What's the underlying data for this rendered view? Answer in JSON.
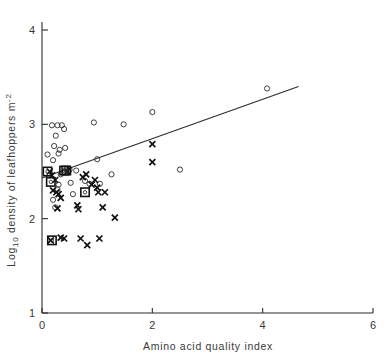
{
  "chart_data": {
    "type": "scatter",
    "title": "",
    "xlabel": "Amino acid quality index",
    "ylabel": "Log10 density of leafhoppers m-2",
    "ylabel_display": "Log₁₀ density of leafhoppers m⁻²",
    "xlim": [
      0,
      6
    ],
    "ylim": [
      1,
      4
    ],
    "xticks": [
      0,
      2,
      4,
      6
    ],
    "xticklabels": [
      "0",
      "2",
      "4",
      "6"
    ],
    "yticks": [
      1,
      2,
      3,
      4
    ],
    "yticklabels": [
      "1",
      "2",
      "3",
      "4"
    ],
    "grid": false,
    "legend": "none",
    "marker_types": [
      "open-circle",
      "cross",
      "boxed"
    ],
    "series": [
      {
        "name": "open-circle",
        "marker": "open-circle",
        "points": [
          [
            0.1,
            2.68
          ],
          [
            0.18,
            2.99
          ],
          [
            0.2,
            2.62
          ],
          [
            0.22,
            2.77
          ],
          [
            0.25,
            2.88
          ],
          [
            0.28,
            2.99
          ],
          [
            0.3,
            2.69
          ],
          [
            0.32,
            2.73
          ],
          [
            0.3,
            2.36
          ],
          [
            0.34,
            2.47
          ],
          [
            0.36,
            2.99
          ],
          [
            0.4,
            2.95
          ],
          [
            0.42,
            2.75
          ],
          [
            0.2,
            2.2
          ],
          [
            0.24,
            2.12
          ],
          [
            0.28,
            2.31
          ],
          [
            0.44,
            2.52
          ],
          [
            0.48,
            2.5
          ],
          [
            0.5,
            2.52
          ],
          [
            0.52,
            2.38
          ],
          [
            0.56,
            2.26
          ],
          [
            0.62,
            2.51
          ],
          [
            0.78,
            2.4
          ],
          [
            0.86,
            2.37
          ],
          [
            0.94,
            3.02
          ],
          [
            1.0,
            2.63
          ],
          [
            1.05,
            2.37
          ],
          [
            1.26,
            2.47
          ],
          [
            1.48,
            3.0
          ],
          [
            2.0,
            3.13
          ],
          [
            2.5,
            2.52
          ],
          [
            4.08,
            3.38
          ]
        ]
      },
      {
        "name": "cross",
        "marker": "cross",
        "points": [
          [
            0.14,
            2.5
          ],
          [
            0.18,
            2.46
          ],
          [
            0.2,
            2.3
          ],
          [
            0.24,
            2.41
          ],
          [
            0.26,
            2.28
          ],
          [
            0.3,
            2.26
          ],
          [
            0.34,
            2.22
          ],
          [
            0.16,
            1.77
          ],
          [
            0.28,
            2.11
          ],
          [
            0.34,
            1.8
          ],
          [
            0.4,
            1.79
          ],
          [
            0.46,
            2.5
          ],
          [
            0.64,
            2.14
          ],
          [
            0.66,
            2.1
          ],
          [
            0.7,
            1.79
          ],
          [
            0.74,
            2.44
          ],
          [
            0.8,
            2.47
          ],
          [
            0.82,
            1.72
          ],
          [
            0.9,
            2.36
          ],
          [
            0.96,
            2.41
          ],
          [
            1.0,
            2.33
          ],
          [
            1.02,
            2.28
          ],
          [
            1.04,
            1.79
          ],
          [
            1.1,
            2.12
          ],
          [
            1.14,
            2.28
          ],
          [
            1.32,
            2.01
          ],
          [
            2.0,
            2.79
          ],
          [
            2.0,
            2.6
          ]
        ]
      },
      {
        "name": "boxed",
        "marker": "boxed",
        "points": [
          [
            0.1,
            2.5
          ],
          [
            0.16,
            2.39
          ],
          [
            0.4,
            2.51
          ],
          [
            0.44,
            2.51
          ],
          [
            0.18,
            1.77
          ],
          [
            0.78,
            2.28
          ]
        ]
      }
    ],
    "regression_line": {
      "x_start": 0.0,
      "y_start": 2.43,
      "x_end": 4.65,
      "y_end": 3.4
    }
  }
}
